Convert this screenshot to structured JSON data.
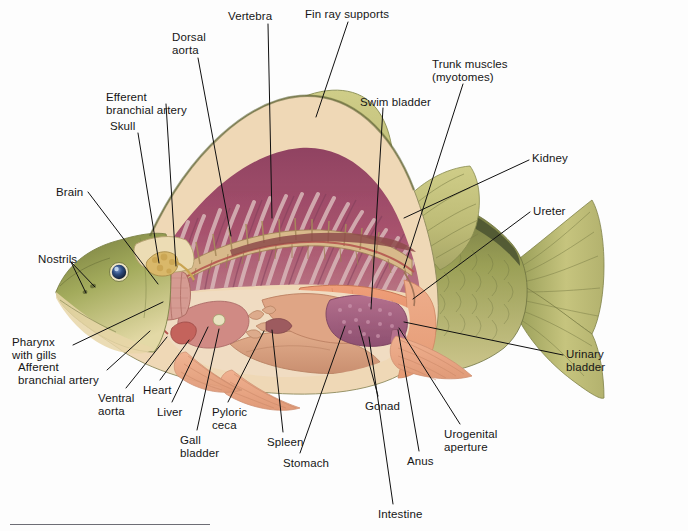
{
  "figure": {
    "type": "anatomical-illustration"
  },
  "colors": {
    "body_olive": "#9aa04f",
    "body_olive_dark": "#6c7039",
    "head_olive": "#a3ab5c",
    "belly_cream": "#f3e2c2",
    "fin_olive": "#c3c27c",
    "fin_ray": "#8e8f52",
    "muscle_magenta": "#9e4a6b",
    "muscle_light": "#c9a8ae",
    "swim_bladder": "#e8936f",
    "flesh_salmon": "#e9a583",
    "viscera_tan": "#d9a183",
    "liver_pink": "#d08a84",
    "gonad_purple": "#a5617f",
    "gonad_speck": "#c48ca4",
    "gill_pink": "#cf8d86",
    "brain_yellow": "#d9b86a",
    "skull_cream": "#ead9b0",
    "eye_blue": "#2f4e82",
    "leader": "#101010",
    "text": "#161616",
    "rule": "#6d6d75",
    "background": "#fdfdfd"
  },
  "labels": [
    {
      "id": "vertebra",
      "text": "Vertebra",
      "x": 228,
      "y": 10,
      "align": "left"
    },
    {
      "id": "fin-ray-supports",
      "text": "Fin ray supports",
      "x": 305,
      "y": 8,
      "align": "left"
    },
    {
      "id": "dorsal-aorta",
      "text": "Dorsal\naorta",
      "x": 172,
      "y": 31,
      "align": "left"
    },
    {
      "id": "trunk-muscles",
      "text": "Trunk muscles\n(myotomes)",
      "x": 432,
      "y": 58,
      "align": "left"
    },
    {
      "id": "efferent-branchial-artery",
      "text": "Efferent\nbranchial artery",
      "x": 106,
      "y": 91,
      "align": "left"
    },
    {
      "id": "swim-bladder",
      "text": "Swim bladder",
      "x": 360,
      "y": 96,
      "align": "left"
    },
    {
      "id": "skull",
      "text": "Skull",
      "x": 110,
      "y": 120,
      "align": "left"
    },
    {
      "id": "kidney",
      "text": "Kidney",
      "x": 532,
      "y": 152,
      "align": "left"
    },
    {
      "id": "brain",
      "text": "Brain",
      "x": 56,
      "y": 186,
      "align": "left"
    },
    {
      "id": "ureter",
      "text": "Ureter",
      "x": 533,
      "y": 205,
      "align": "left"
    },
    {
      "id": "nostrils",
      "text": "Nostrils",
      "x": 38,
      "y": 253,
      "align": "left"
    },
    {
      "id": "pharynx-with-gills",
      "text": "Pharynx\nwith gills",
      "x": 12,
      "y": 336,
      "align": "left"
    },
    {
      "id": "urinary-bladder",
      "text": "Urinary\nbladder",
      "x": 566,
      "y": 348,
      "align": "left"
    },
    {
      "id": "afferent-branchial-artery",
      "text": "Afferent\nbranchial artery",
      "x": 18,
      "y": 361,
      "align": "left"
    },
    {
      "id": "heart",
      "text": "Heart",
      "x": 143,
      "y": 384,
      "align": "left"
    },
    {
      "id": "ventral-aorta",
      "text": "Ventral\naorta",
      "x": 98,
      "y": 392,
      "align": "left"
    },
    {
      "id": "liver",
      "text": "Liver",
      "x": 157,
      "y": 406,
      "align": "left"
    },
    {
      "id": "pyloric-ceca",
      "text": "Pyloric\nceca",
      "x": 212,
      "y": 406,
      "align": "left"
    },
    {
      "id": "gonad",
      "text": "Gonad",
      "x": 365,
      "y": 400,
      "align": "left"
    },
    {
      "id": "spleen",
      "text": "Spleen",
      "x": 267,
      "y": 436,
      "align": "left"
    },
    {
      "id": "gall-bladder",
      "text": "Gall\nbladder",
      "x": 180,
      "y": 434,
      "align": "left"
    },
    {
      "id": "urogenital-aperture",
      "text": "Urogenital\naperture",
      "x": 444,
      "y": 428,
      "align": "left"
    },
    {
      "id": "stomach",
      "text": "Stomach",
      "x": 283,
      "y": 457,
      "align": "left"
    },
    {
      "id": "anus",
      "text": "Anus",
      "x": 407,
      "y": 455,
      "align": "left"
    },
    {
      "id": "intestine",
      "text": "Intestine",
      "x": 378,
      "y": 508,
      "align": "left"
    }
  ],
  "leaders": [
    {
      "id": "vertebra",
      "points": "268,24 272,218"
    },
    {
      "id": "fin-ray-supports",
      "points": "348,22 316,117"
    },
    {
      "id": "dorsal-aorta",
      "points": "198,58 231,236"
    },
    {
      "id": "trunk-muscles",
      "points": "463,84 404,268"
    },
    {
      "id": "efferent-branchial-artery",
      "points": "166,104 176,266"
    },
    {
      "id": "swim-bladder",
      "points": "383,108 371,309"
    },
    {
      "id": "skull",
      "points": "138,133 159,263"
    },
    {
      "id": "kidney",
      "points": "529,160 404,218"
    },
    {
      "id": "brain",
      "points": "88,192 158,284"
    },
    {
      "id": "ureter",
      "points": "530,212 413,299"
    },
    {
      "id": "nostrils",
      "points": "71,262 95,287"
    },
    {
      "id": "nostrils2",
      "points": "71,262 86,293"
    },
    {
      "id": "pharynx-with-gills",
      "points": "73,345 163,302"
    },
    {
      "id": "urinary-bladder",
      "points": "563,355 404,322"
    },
    {
      "id": "afferent-branchial-artery",
      "points": "107,370 150,331"
    },
    {
      "id": "heart",
      "points": "160,380 189,340"
    },
    {
      "id": "ventral-aorta",
      "points": "126,388 167,337"
    },
    {
      "id": "liver",
      "points": "172,402 208,327"
    },
    {
      "id": "pyloric-ceca",
      "points": "228,402 264,331"
    },
    {
      "id": "gonad",
      "points": "378,396 359,326"
    },
    {
      "id": "spleen",
      "points": "283,432 272,330"
    },
    {
      "id": "gall-bladder",
      "points": "197,430 219,329"
    },
    {
      "id": "urogenital-aperture",
      "points": "460,424 399,328"
    },
    {
      "id": "stomach",
      "points": "300,453 345,326"
    },
    {
      "id": "anus",
      "points": "419,451 398,330"
    },
    {
      "id": "intestine",
      "points": "393,504 369,337"
    }
  ]
}
